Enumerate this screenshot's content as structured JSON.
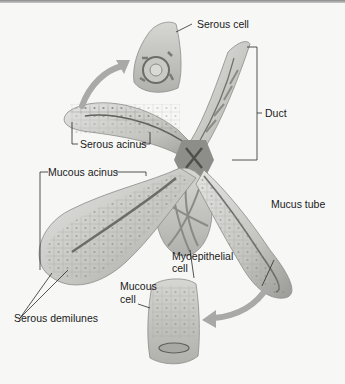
{
  "figure": {
    "colors": {
      "background": "#f7f7f6",
      "tissue_light": "#dcdcda",
      "tissue_mid": "#b9b9b6",
      "tissue_dark": "#7d7d7a",
      "arrow": "#a9a9a7",
      "leader_line": "#2a2a2a",
      "text": "#1a1a1a"
    },
    "labels": {
      "serous_cell": "Serous cell",
      "duct": "Duct",
      "serous_acinus": "Serous acinus",
      "mucous_acinus": "Mucous acinus",
      "mucus_tube": "Mucus tube",
      "myoepithelial_cell_line1": "Myoepithelial",
      "myoepithelial_cell_line2": "cell",
      "mucous_cell_line1": "Mucous",
      "mucous_cell_line2": "cell",
      "serous_demilunes": "Serous demilunes"
    }
  }
}
